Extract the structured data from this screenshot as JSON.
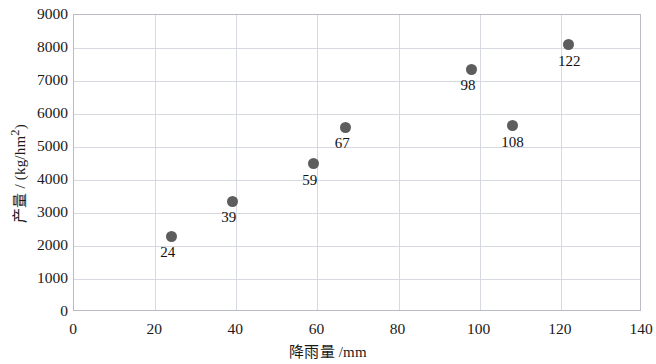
{
  "chart_data": {
    "type": "scatter",
    "title": "",
    "xlabel": "降雨量 /mm",
    "ylabel": "产量 / (kg/hm2)",
    "ylabel_display": "产量 / (kg/hm²)",
    "xlim": [
      0,
      140
    ],
    "ylim": [
      0,
      9000
    ],
    "xticks": [
      0,
      20,
      40,
      60,
      80,
      100,
      120,
      140
    ],
    "yticks": [
      0,
      1000,
      2000,
      3000,
      4000,
      5000,
      6000,
      7000,
      8000,
      9000
    ],
    "xtick_labels": [
      "0",
      "20",
      "40",
      "60",
      "80",
      "100",
      "120",
      "140"
    ],
    "ytick_labels": [
      "0",
      "1000",
      "2000",
      "3000",
      "4000",
      "5000",
      "6000",
      "7000",
      "8000",
      "9000"
    ],
    "grid": "horizontal-and-vertical",
    "legend": "none",
    "marker_color": "#5d5d5d",
    "grid_color": "#d6d9e0",
    "frame_color": "#b9bcc4",
    "x": [
      24,
      39,
      59,
      67,
      98,
      108,
      122
    ],
    "y": [
      2300,
      3350,
      4500,
      5600,
      7350,
      5650,
      8100
    ],
    "point_labels": [
      "24",
      "39",
      "59",
      "67",
      "98",
      "108",
      "122"
    ],
    "points": [
      {
        "label": "24",
        "x": 24,
        "y": 2300,
        "label_pos": "below-left"
      },
      {
        "label": "39",
        "x": 39,
        "y": 3350,
        "label_pos": "below-left"
      },
      {
        "label": "59",
        "x": 59,
        "y": 4500,
        "label_pos": "below-left"
      },
      {
        "label": "67",
        "x": 67,
        "y": 5600,
        "label_pos": "below-left"
      },
      {
        "label": "98",
        "x": 98,
        "y": 7350,
        "label_pos": "below-left"
      },
      {
        "label": "108",
        "x": 108,
        "y": 5650,
        "label_pos": "below-left"
      },
      {
        "label": "122",
        "x": 122,
        "y": 8100,
        "label_pos": "below-left"
      }
    ]
  }
}
